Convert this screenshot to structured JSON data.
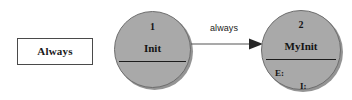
{
  "diagram": {
    "background_color": "#ffffff",
    "legend": {
      "label": "Always",
      "fill_color": "#ffffff",
      "border_color": "#4a4a4a"
    },
    "nodes": [
      {
        "id": "1",
        "name": "Init",
        "fill_color": "#a9a9a9",
        "border_color": "#6d6d6d",
        "slots": []
      },
      {
        "id": "2",
        "name": "MyInit",
        "fill_color": "#a9a9a9",
        "border_color": "#6d6d6d",
        "slots": [
          {
            "key": "E:"
          },
          {
            "key": "I:"
          }
        ]
      }
    ],
    "transitions": [
      {
        "label": "always",
        "from": "1",
        "to": "2",
        "color": "#555555"
      }
    ]
  }
}
